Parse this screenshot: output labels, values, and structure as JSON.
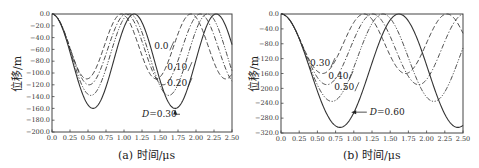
{
  "chart_data": [
    {
      "type": "line",
      "panel": "a",
      "caption": "(a) 时间/μs",
      "xlabel": "时间/μs",
      "ylabel": "位移/m",
      "xlim": [
        0.0,
        2.5
      ],
      "ylim": [
        -200.0,
        0.0
      ],
      "xticks": [
        "0.0",
        "0.25",
        "0.50",
        "0.75",
        "1.00",
        "1.25",
        "1.50",
        "1.75",
        "2.00",
        "2.25",
        "2.50"
      ],
      "yticks": [
        "0.0",
        "-20.0",
        "-40.0",
        "-60.0",
        "-80.0",
        "-100.0",
        "-120.0",
        "-140.0",
        "-160.0",
        "-180.0",
        "-200.0"
      ],
      "grid": false,
      "series": [
        {
          "name": "0.0",
          "style": "long-dash",
          "period": 0.965,
          "amplitude": 110,
          "x": [
            0.0,
            0.48,
            0.97,
            1.45,
            1.93,
            2.41,
            2.5
          ],
          "y": [
            0,
            -110,
            0,
            -110,
            0,
            -110,
            -105
          ]
        },
        {
          "name": "0.10",
          "style": "dash-dot",
          "period": 1.03,
          "amplitude": 120,
          "x": [
            0.0,
            0.52,
            1.03,
            1.55,
            2.06,
            2.5
          ],
          "y": [
            0,
            -120,
            0,
            -120,
            0,
            -110
          ]
        },
        {
          "name": "0.20",
          "style": "dash-dot-dot",
          "period": 1.08,
          "amplitude": 138,
          "x": [
            0.0,
            0.54,
            1.08,
            1.62,
            2.16,
            2.5
          ],
          "y": [
            0,
            -138,
            0,
            -138,
            0,
            -85
          ]
        },
        {
          "name": "D=0.30",
          "style": "solid",
          "period": 1.14,
          "amplitude": 160,
          "x": [
            0.0,
            0.57,
            1.14,
            1.71,
            2.28,
            2.5
          ],
          "y": [
            0,
            -160,
            0,
            -160,
            0,
            -58
          ]
        }
      ],
      "annotations": [
        {
          "text": "0.0",
          "x": 1.42,
          "y": -60
        },
        {
          "text": "0.10",
          "x": 1.6,
          "y": -95
        },
        {
          "text": "0.20",
          "x": 1.6,
          "y": -122
        },
        {
          "text": "D=0.30",
          "x": 1.25,
          "y": -175,
          "arrow_to": [
            1.71,
            -160
          ]
        }
      ]
    },
    {
      "type": "line",
      "panel": "b",
      "caption": "(b) 时间/μs",
      "xlabel": "时间/μs",
      "ylabel": "位移/m",
      "xlim": [
        0.0,
        2.5
      ],
      "ylim": [
        -320.0,
        0.0
      ],
      "xticks": [
        "0.0",
        "0.25",
        "0.50",
        "0.75",
        "1.00",
        "1.25",
        "1.50",
        "1.75",
        "2.00",
        "2.25",
        "2.50"
      ],
      "yticks": [
        "0.0",
        "-40.0",
        "-80.0",
        "-120.0",
        "-160.0",
        "-200.0",
        "-240.0",
        "-280.0",
        "-320.0"
      ],
      "grid": false,
      "series": [
        {
          "name": "0.30",
          "style": "long-dash",
          "period": 1.14,
          "amplitude": 160,
          "x": [
            0.0,
            0.57,
            1.14,
            1.71,
            2.28,
            2.5
          ],
          "y": [
            0,
            -160,
            0,
            -160,
            0,
            -58
          ]
        },
        {
          "name": "0.40",
          "style": "dash-dot",
          "period": 1.26,
          "amplitude": 190,
          "x": [
            0.0,
            0.63,
            1.26,
            1.89,
            2.52
          ],
          "y": [
            0,
            -190,
            0,
            -190,
            0
          ]
        },
        {
          "name": "0.50",
          "style": "dash-dot-dot",
          "period": 1.4,
          "amplitude": 235,
          "x": [
            0.0,
            0.7,
            1.4,
            2.1,
            2.5
          ],
          "y": [
            0,
            -235,
            0,
            -235,
            -70
          ]
        },
        {
          "name": "D=0.60",
          "style": "solid",
          "period": 1.62,
          "amplitude": 305,
          "x": [
            0.0,
            0.81,
            1.62,
            2.43,
            2.5
          ],
          "y": [
            0,
            -305,
            0,
            -305,
            -300
          ]
        }
      ],
      "annotations": [
        {
          "text": "0.30",
          "x": 0.4,
          "y": -140
        },
        {
          "text": "0.40",
          "x": 0.65,
          "y": -175
        },
        {
          "text": "0.50",
          "x": 0.73,
          "y": -205
        },
        {
          "text": "D=0.60",
          "x": 1.22,
          "y": -272,
          "arrow_to": [
            0.95,
            -272
          ]
        }
      ]
    }
  ],
  "labels": {
    "ylabel_a": "位移/m",
    "ylabel_b": "位移/m",
    "caption_a": "(a) 时间/μs",
    "caption_b": "(b) 时间/μs"
  }
}
